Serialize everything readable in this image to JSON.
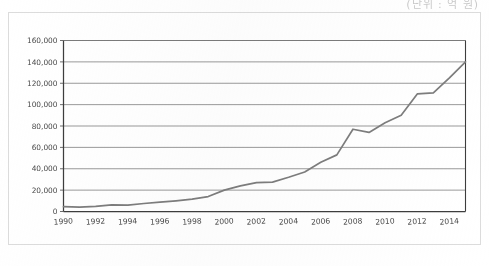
{
  "corner_note": "(단위 : 억 원)",
  "chart_data": {
    "type": "line",
    "title": "",
    "subtitle": "",
    "xlabel": "",
    "ylabel": "",
    "x": [
      1990,
      1991,
      1992,
      1993,
      1994,
      1995,
      1996,
      1997,
      1998,
      1999,
      2000,
      2001,
      2002,
      2003,
      2004,
      2005,
      2006,
      2007,
      2008,
      2009,
      2010,
      2011,
      2012,
      2013,
      2014,
      2015
    ],
    "values": [
      4500,
      4000,
      4800,
      6200,
      6000,
      7500,
      8800,
      10000,
      11500,
      14000,
      20000,
      24000,
      27000,
      27500,
      32000,
      37000,
      46000,
      53000,
      77000,
      74000,
      83000,
      90000,
      110000,
      111000,
      125000,
      140000
    ],
    "series": [
      {
        "name": "",
        "values": [
          4500,
          4000,
          4800,
          6200,
          6000,
          7500,
          8800,
          10000,
          11500,
          14000,
          20000,
          24000,
          27000,
          27500,
          32000,
          37000,
          46000,
          53000,
          77000,
          74000,
          83000,
          90000,
          110000,
          111000,
          125000,
          140000
        ]
      }
    ],
    "ylim": [
      0,
      160000
    ],
    "xlim": [
      1990,
      2015
    ],
    "ytick_values": [
      0,
      20000,
      40000,
      60000,
      80000,
      100000,
      120000,
      140000,
      160000
    ],
    "ytick_labels": [
      "0",
      "20,000",
      "40,000",
      "60,000",
      "80,000",
      "100,000",
      "120,000",
      "140,000",
      "160,000"
    ],
    "xtick_values": [
      1990,
      1992,
      1994,
      1996,
      1998,
      2000,
      2002,
      2004,
      2006,
      2008,
      2010,
      2012,
      2014
    ],
    "xtick_labels": [
      "1990",
      "1992",
      "1994",
      "1996",
      "1998",
      "2000",
      "2002",
      "2004",
      "2006",
      "2008",
      "2010",
      "2012",
      "2014"
    ],
    "grid": true,
    "grid_axis": "y",
    "legend": false,
    "legend_position": "none",
    "line_color": "#7d7d7d",
    "axis_color": "#3d3d3d",
    "grid_color": "#6e6e6e",
    "background_color": "#ffffff"
  }
}
